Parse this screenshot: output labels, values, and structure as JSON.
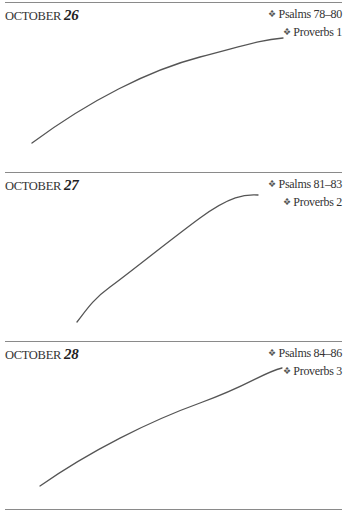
{
  "bullet_icon": "❖",
  "entries": [
    {
      "month": "October",
      "day": "26",
      "readings": [
        "Psalms 78–80",
        "Proverbs 1"
      ]
    },
    {
      "month": "October",
      "day": "27",
      "readings": [
        "Psalms 81–83",
        "Proverbs 2"
      ]
    },
    {
      "month": "October",
      "day": "28",
      "readings": [
        "Psalms 84–86",
        "Proverbs 3"
      ]
    }
  ],
  "colors": {
    "rule": "#8a8a8a",
    "text": "#333333",
    "ink_stroke": "#555555"
  }
}
